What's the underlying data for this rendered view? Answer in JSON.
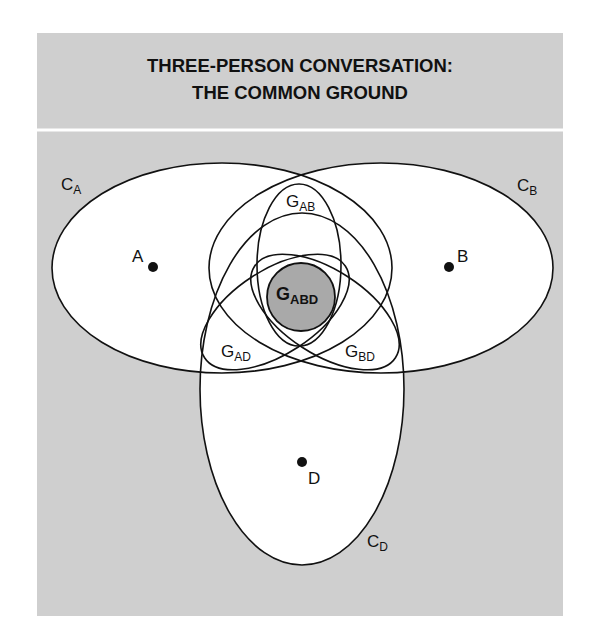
{
  "title": {
    "line1": "THREE-PERSON CONVERSATION:",
    "line2": "THE COMMON GROUND"
  },
  "colors": {
    "panel_background": "#cfcfcf",
    "region_fill": "#ffffff",
    "core_fill": "#a9a9a9",
    "stroke": "#111111"
  },
  "persons": [
    {
      "id": "A",
      "label": "A"
    },
    {
      "id": "B",
      "label": "B"
    },
    {
      "id": "D",
      "label": "D"
    }
  ],
  "contexts": [
    {
      "id": "CA",
      "main": "C",
      "sub": "A"
    },
    {
      "id": "CB",
      "main": "C",
      "sub": "B"
    },
    {
      "id": "CD",
      "main": "C",
      "sub": "D"
    }
  ],
  "common_grounds": [
    {
      "id": "GAB",
      "main": "G",
      "sub": "AB"
    },
    {
      "id": "GAD",
      "main": "G",
      "sub": "AD"
    },
    {
      "id": "GBD",
      "main": "G",
      "sub": "BD"
    },
    {
      "id": "GABD",
      "main": "G",
      "sub": "ABD",
      "highlighted": true
    }
  ]
}
